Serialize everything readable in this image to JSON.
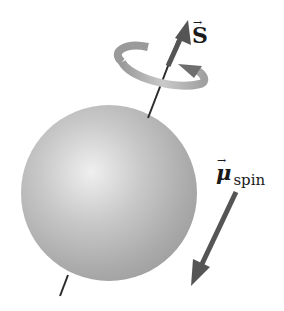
{
  "diagram": {
    "sphere": {
      "cx": 109,
      "cy": 193,
      "r": 88,
      "color": "#bdbdbd",
      "highlight": "#ececec",
      "shadow": "#9e9e9e"
    },
    "spin_axis": {
      "color": "#2b2b2b"
    },
    "rotation_ring": {
      "color": "#a8a8a8",
      "arrow_color": "#6e6e6e"
    },
    "spin_vector": {
      "color": "#555555",
      "label": "S",
      "vector_mark": "→"
    },
    "magnetic_moment_vector": {
      "color": "#555555",
      "label": "μ",
      "subscript": "spin",
      "vector_mark": "→"
    }
  }
}
